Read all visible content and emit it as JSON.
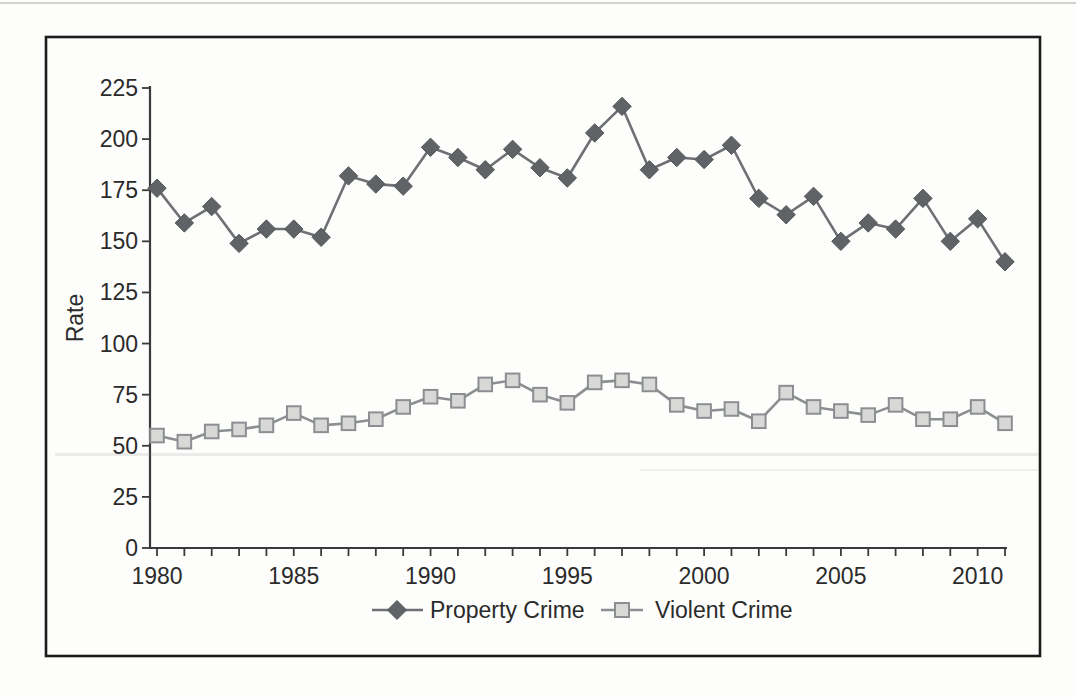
{
  "figure": {
    "ylabel": "Rate",
    "border_color": "#1c1c1c",
    "axis_color": "#3a3a3a",
    "text_color": "#2b2b2b",
    "background": "#fdfdfb"
  },
  "chart_data": {
    "type": "line",
    "title": "",
    "xlabel": "",
    "ylabel": "Rate",
    "grid": false,
    "legend_position": "bottom-center",
    "ylim": [
      0,
      225
    ],
    "yticks": [
      0,
      25,
      50,
      75,
      100,
      125,
      150,
      175,
      200,
      225
    ],
    "x": [
      1980,
      1981,
      1982,
      1983,
      1984,
      1985,
      1986,
      1987,
      1988,
      1989,
      1990,
      1991,
      1992,
      1993,
      1994,
      1995,
      1996,
      1997,
      1998,
      1999,
      2000,
      2001,
      2002,
      2003,
      2004,
      2005,
      2006,
      2007,
      2008,
      2009,
      2010,
      2011
    ],
    "xtick_labels": [
      "1980",
      "1985",
      "1990",
      "1995",
      "2000",
      "2005",
      "2010"
    ],
    "xtick_label_years": [
      1980,
      1985,
      1990,
      1995,
      2000,
      2005,
      2010
    ],
    "series": [
      {
        "name": "Property Crime",
        "marker": "diamond",
        "line_color": "#6d7074",
        "marker_fill": "#5f6366",
        "marker_edge": "#54585a",
        "values": [
          176,
          159,
          167,
          149,
          156,
          156,
          152,
          182,
          178,
          177,
          196,
          191,
          185,
          195,
          186,
          181,
          203,
          216,
          185,
          191,
          190,
          197,
          171,
          163,
          172,
          150,
          159,
          156,
          171,
          150,
          161,
          140
        ]
      },
      {
        "name": "Violent Crime",
        "marker": "square",
        "line_color": "#8b8f92",
        "marker_fill": "#d8d9d6",
        "marker_edge": "#8b8f92",
        "values": [
          55,
          52,
          57,
          58,
          60,
          66,
          60,
          61,
          63,
          69,
          74,
          72,
          80,
          82,
          75,
          71,
          81,
          82,
          80,
          70,
          67,
          68,
          62,
          76,
          69,
          67,
          65,
          70,
          63,
          63,
          69,
          61
        ]
      }
    ]
  }
}
